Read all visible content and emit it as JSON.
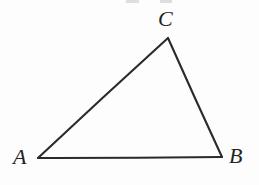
{
  "figure": {
    "kind": "geometry-diagram",
    "shape": "triangle",
    "background_color": "#fdfdfd",
    "stroke_color": "#2a2a2a",
    "stroke_width": 2.1,
    "label_color": "#232323",
    "width": 259,
    "height": 185,
    "vertices": [
      {
        "id": "A",
        "label": "A",
        "x": 38,
        "y": 158
      },
      {
        "id": "B",
        "label": "B",
        "x": 222,
        "y": 157
      },
      {
        "id": "C",
        "label": "C",
        "x": 168,
        "y": 38
      }
    ],
    "edges": [
      {
        "id": "AB",
        "from": "A",
        "to": "B"
      },
      {
        "id": "BC",
        "from": "B",
        "to": "C"
      },
      {
        "id": "CA",
        "from": "C",
        "to": "A"
      }
    ],
    "label_positions": {
      "A": {
        "x": 13,
        "y": 146,
        "placement": "left-of-vertex"
      },
      "B": {
        "x": 229,
        "y": 145,
        "placement": "right-of-vertex"
      },
      "C": {
        "x": 158,
        "y": 8,
        "placement": "above-vertex"
      }
    },
    "artifacts": {
      "description": "faint clipped marks along top edge",
      "color": "#d8d8d8"
    }
  }
}
